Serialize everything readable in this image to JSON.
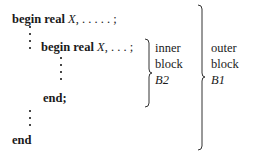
{
  "outer_block": {
    "begin_kw": "begin real",
    "var": "X",
    "rest": ", . . . . . ;",
    "end": "end",
    "label": [
      "outer",
      "block",
      "B1"
    ]
  },
  "inner_block": {
    "begin_kw": "begin real",
    "var": "X",
    "rest": ", . . . ;",
    "end": "end;",
    "label": [
      "inner",
      "block",
      "B2"
    ]
  }
}
